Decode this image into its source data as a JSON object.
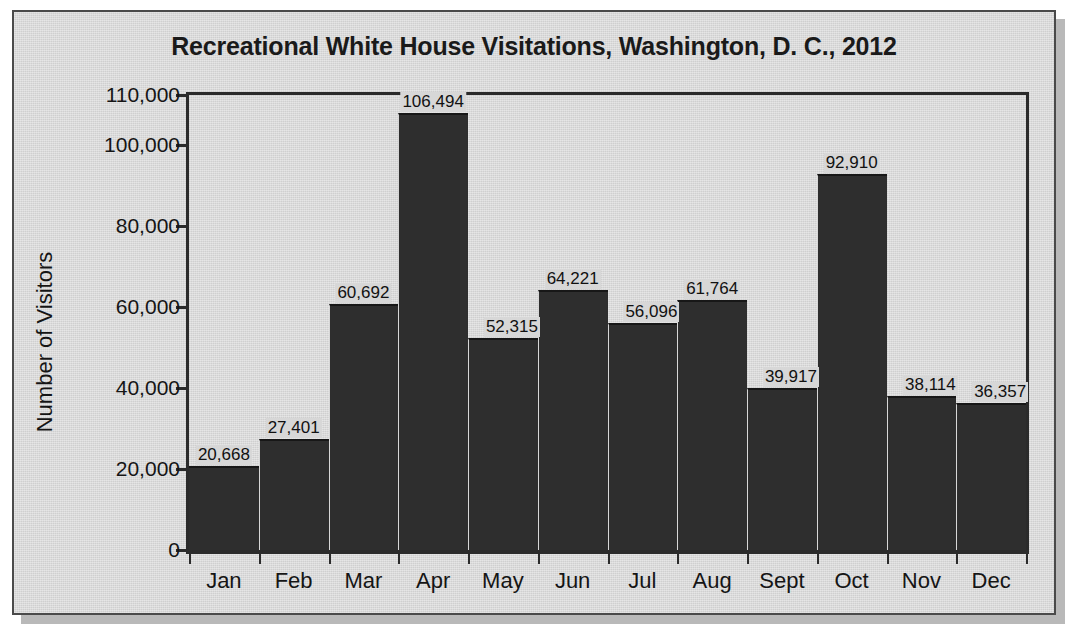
{
  "figure": {
    "title": "Recreational White House Visitations, Washington, D. C., 2012",
    "background_color": "#d7d7d7",
    "frame_color": "#4a4a4a",
    "bar_color": "#2e2e2e",
    "axis_color": "#2b2b2b"
  },
  "chart_data": {
    "type": "bar",
    "title": "Recreational White House Visitations, Washington, D. C., 2012",
    "xlabel": "",
    "ylabel": "Number of Visitors",
    "categories": [
      "Jan",
      "Feb",
      "Mar",
      "Apr",
      "May",
      "Jun",
      "Jul",
      "Aug",
      "Sept",
      "Oct",
      "Nov",
      "Dec"
    ],
    "values": [
      20668,
      27401,
      60692,
      106494,
      52315,
      64221,
      56096,
      61764,
      39917,
      92910,
      38114,
      36357
    ],
    "value_labels": [
      "20,668",
      "27,401",
      "60,692",
      "106,494",
      "52,315",
      "64,221",
      "56,096",
      "61,764",
      "39,917",
      "92,910",
      "38,114",
      "36,357"
    ],
    "ylim": [
      0,
      110000
    ],
    "yticks": [
      0,
      20000,
      40000,
      60000,
      80000,
      100000,
      110000
    ],
    "ytick_labels": [
      "0",
      "20,000",
      "40,000",
      "60,000",
      "80,000",
      "100,000",
      "110,000"
    ],
    "grid": false,
    "legend": null,
    "bars_adjacent": true
  }
}
